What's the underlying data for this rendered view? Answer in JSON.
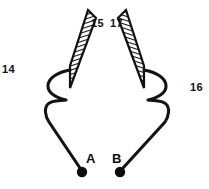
{
  "figure": {
    "kind": "patent-line-drawing",
    "background_color": "#ffffff",
    "ink_color": "#111111",
    "plates": [
      {
        "id": "left-plate",
        "hatch_direction": "down-right",
        "outline_color": "#111111",
        "fill_color": "#ffffff",
        "points": "88,10 70,66 70,88 96,18",
        "corners": {
          "top_right_x": 88,
          "top_right_y": 10,
          "bottom_left_x": 70,
          "bottom_left_y": 88
        }
      },
      {
        "id": "right-plate",
        "hatch_direction": "down-right",
        "outline_color": "#111111",
        "fill_color": "#ffffff",
        "points": "126,10 144,66 144,88 118,18",
        "corners": {
          "top_left_x": 126,
          "top_left_y": 10,
          "bottom_right_x": 144,
          "bottom_right_y": 88
        }
      }
    ],
    "leads": [
      {
        "id": "left-lead",
        "from_plate": "left-plate",
        "to_terminal": "A",
        "stroke_width": 3
      },
      {
        "id": "right-lead",
        "from_plate": "right-plate",
        "to_terminal": "B",
        "stroke_width": 3
      }
    ],
    "terminals": [
      {
        "name": "A",
        "cx": 82,
        "cy": 172,
        "r": 5,
        "label_x": 86,
        "label_y": 153
      },
      {
        "name": "B",
        "cx": 120,
        "cy": 172,
        "r": 5,
        "label_x": 112,
        "label_y": 153
      }
    ],
    "reference_numerals": [
      {
        "text": "14",
        "x": 2,
        "y": 64
      },
      {
        "text": "15",
        "x": 91,
        "y": 18
      },
      {
        "text": "17",
        "x": 110,
        "y": 18
      },
      {
        "text": "16",
        "x": 190,
        "y": 82
      }
    ],
    "terminal_labels": [
      {
        "text": "A",
        "x": 86,
        "y": 152
      },
      {
        "text": "B",
        "x": 112,
        "y": 152
      }
    ],
    "caption_partial": ""
  }
}
